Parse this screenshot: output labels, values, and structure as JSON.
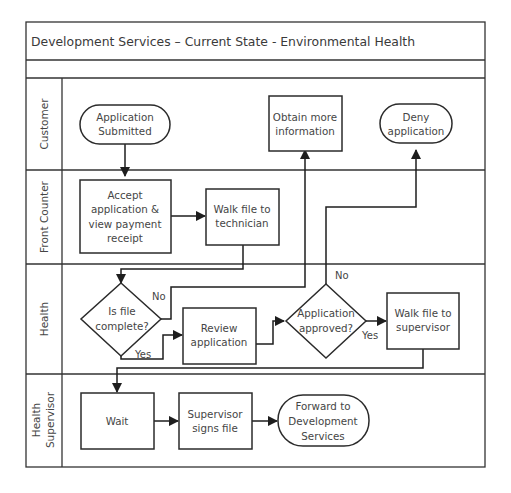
{
  "diagram": {
    "title": "Development Services – Current State - Environmental Health",
    "lanes": [
      {
        "id": "customer",
        "label_lines": [
          "Customer"
        ]
      },
      {
        "id": "front-counter",
        "label_lines": [
          "Front Counter"
        ]
      },
      {
        "id": "health",
        "label_lines": [
          "Health"
        ]
      },
      {
        "id": "health-supervisor",
        "label_lines": [
          "Health",
          "Supervisor"
        ]
      }
    ],
    "nodes": {
      "application_submitted": {
        "type": "terminator",
        "lane": "customer",
        "lines": [
          "Application",
          "Submitted"
        ]
      },
      "obtain_more_information": {
        "type": "process",
        "lane": "customer",
        "lines": [
          "Obtain more",
          "information"
        ]
      },
      "deny_application": {
        "type": "terminator",
        "lane": "customer",
        "lines": [
          "Deny",
          "application"
        ]
      },
      "accept_application": {
        "type": "process",
        "lane": "front-counter",
        "lines": [
          "Accept",
          "application &",
          "view payment",
          "receipt"
        ]
      },
      "walk_file_to_technician": {
        "type": "process",
        "lane": "front-counter",
        "lines": [
          "Walk file to",
          "technician"
        ]
      },
      "is_file_complete": {
        "type": "decision",
        "lane": "health",
        "lines": [
          "Is file",
          "complete?"
        ]
      },
      "review_application": {
        "type": "process",
        "lane": "health",
        "lines": [
          "Review",
          "application"
        ]
      },
      "application_approved": {
        "type": "decision",
        "lane": "health",
        "lines": [
          "Application",
          "approved?"
        ]
      },
      "walk_file_to_supervisor": {
        "type": "process",
        "lane": "health",
        "lines": [
          "Walk file to",
          "supervisor"
        ]
      },
      "wait": {
        "type": "process",
        "lane": "health-supervisor",
        "lines": [
          "Wait"
        ]
      },
      "supervisor_signs_file": {
        "type": "process",
        "lane": "health-supervisor",
        "lines": [
          "Supervisor",
          "signs file"
        ]
      },
      "forward_to_dev_services": {
        "type": "terminator",
        "lane": "health-supervisor",
        "lines": [
          "Forward to",
          "Development",
          "Services"
        ]
      }
    },
    "edges": [
      {
        "from": "application_submitted",
        "to": "accept_application",
        "label": ""
      },
      {
        "from": "accept_application",
        "to": "walk_file_to_technician",
        "label": ""
      },
      {
        "from": "walk_file_to_technician",
        "to": "is_file_complete",
        "label": ""
      },
      {
        "from": "is_file_complete",
        "to": "obtain_more_information",
        "label": "No"
      },
      {
        "from": "is_file_complete",
        "to": "review_application",
        "label": "Yes"
      },
      {
        "from": "review_application",
        "to": "application_approved",
        "label": ""
      },
      {
        "from": "application_approved",
        "to": "deny_application",
        "label": "No"
      },
      {
        "from": "application_approved",
        "to": "walk_file_to_supervisor",
        "label": "Yes"
      },
      {
        "from": "walk_file_to_supervisor",
        "to": "wait",
        "label": ""
      },
      {
        "from": "wait",
        "to": "supervisor_signs_file",
        "label": ""
      },
      {
        "from": "supervisor_signs_file",
        "to": "forward_to_dev_services",
        "label": ""
      }
    ],
    "edge_labels": {
      "file_complete_no": "No",
      "file_complete_yes": "Yes",
      "approved_no": "No",
      "approved_yes": "Yes"
    }
  }
}
